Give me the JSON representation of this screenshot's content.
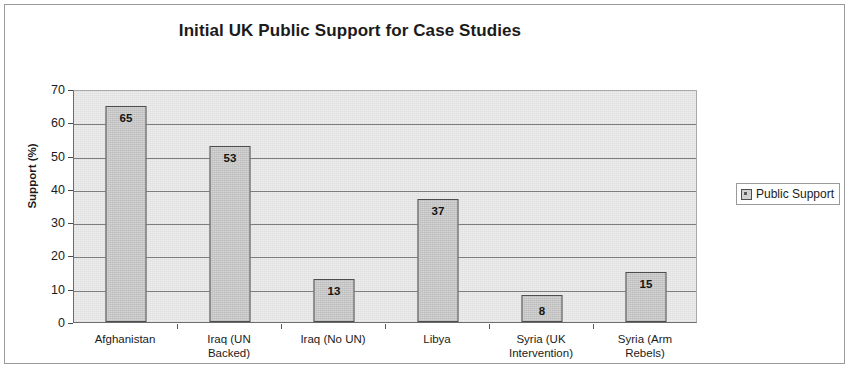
{
  "chart_data": {
    "type": "bar",
    "title": "Initial UK Public Support for Case Studies",
    "xlabel": "",
    "ylabel": "Support (%)",
    "ylim": [
      0,
      70
    ],
    "ytick_step": 10,
    "yticks": [
      "70",
      "60",
      "50",
      "40",
      "30",
      "20",
      "10",
      "0"
    ],
    "grid": true,
    "legend_position": "right",
    "categories": [
      "Afghanistan",
      "Iraq (UN Backed)",
      "Iraq (No UN)",
      "Libya",
      "Syria (UK Intervention)",
      "Syria (Arm Rebels)"
    ],
    "category_lines": [
      [
        "Afghanistan"
      ],
      [
        "Iraq (UN",
        "Backed)"
      ],
      [
        "Iraq (No UN)"
      ],
      [
        "Libya"
      ],
      [
        "Syria (UK",
        "Intervention)"
      ],
      [
        "Syria (Arm",
        "Rebels)"
      ]
    ],
    "values": [
      65,
      53,
      13,
      37,
      8,
      15
    ],
    "value_labels": [
      "65",
      "53",
      "13",
      "37",
      "8",
      "15"
    ],
    "series": [
      {
        "name": "Public Support",
        "values": [
          65,
          53,
          13,
          37,
          8,
          15
        ]
      }
    ],
    "colors": {
      "bar_fill": "#cfcfcf",
      "bar_border": "#4d4d4d",
      "plot_background": "#ececec",
      "gridline": "#7d7d7d",
      "text": "#1b1b1b"
    }
  },
  "legend": {
    "entries": [
      {
        "label": "Public Support",
        "marker": "series-swatch-icon"
      }
    ]
  }
}
